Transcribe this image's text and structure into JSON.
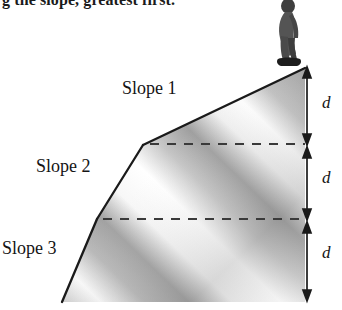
{
  "figure": {
    "caption_partial": "g the slope, greatest first.",
    "labels": {
      "slope1": "Slope 1",
      "slope2": "Slope 2",
      "slope3": "Slope 3"
    },
    "distance_labels": [
      "d",
      "d",
      "d"
    ],
    "colors": {
      "outline": "#1a1a1a",
      "text": "#141414",
      "fill_light": "#f2f2f2",
      "fill_mid": "#b9b9b9",
      "fill_dark": "#8f8f8f",
      "dashed": "#3a3a3a",
      "person": "#4a4a4a"
    },
    "geometry": {
      "apex": [
        305,
        68
      ],
      "break1": [
        143,
        145
      ],
      "break2": [
        97,
        219
      ],
      "base_left": [
        62,
        302
      ],
      "base_right": [
        305,
        302
      ],
      "dashed_y": [
        144,
        219
      ],
      "arrow_x": 307,
      "arrow_stops": [
        70,
        144,
        219,
        300
      ]
    },
    "elements": {
      "person_alt": "standing figure at hill summit",
      "arrow_alt": "double-headed vertical measurement arrow"
    }
  }
}
